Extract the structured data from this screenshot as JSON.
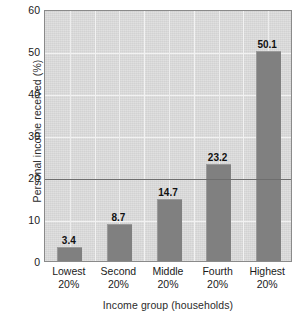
{
  "chart_data": {
    "type": "bar",
    "title": "",
    "subtitle": "",
    "xlabel": "Income group (households)",
    "ylabel": "Personal income received (%)",
    "categories": [
      "Lowest 20%",
      "Second 20%",
      "Middle 20%",
      "Fourth 20%",
      "Highest 20%"
    ],
    "category_lines": [
      {
        "line1": "Lowest",
        "line2": "20%"
      },
      {
        "line1": "Second",
        "line2": "20%"
      },
      {
        "line1": "Middle",
        "line2": "20%"
      },
      {
        "line1": "Fourth",
        "line2": "20%"
      },
      {
        "line1": "Highest",
        "line2": "20%"
      }
    ],
    "values": [
      3.4,
      8.7,
      14.7,
      23.2,
      50.1
    ],
    "value_labels": [
      "3.4",
      "8.7",
      "14.7",
      "23.2",
      "50.1"
    ],
    "ylim": [
      0,
      60
    ],
    "yticks": [
      0,
      10,
      20,
      30,
      40,
      50,
      60
    ],
    "ytick_labels": [
      "0",
      "10",
      "20",
      "30",
      "40",
      "50",
      "60"
    ],
    "grid": true,
    "legend": "none",
    "reference_line": 20,
    "colors": {
      "bar": "#808080",
      "plot_background": "#d9d9d9",
      "gridline": "#f2f2f2",
      "reference_line": "#6e6e6e",
      "plot_border": "#8a8a8a",
      "text": "#1a1a1a",
      "page_background": "#ffffff"
    }
  }
}
